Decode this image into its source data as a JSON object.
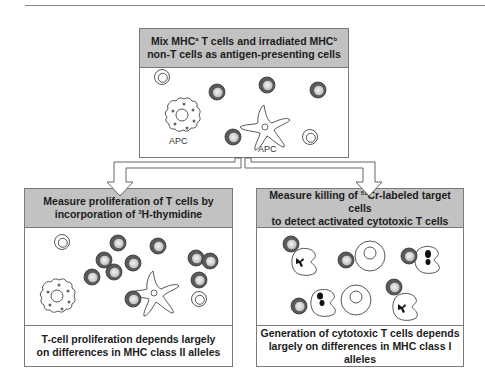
{
  "top_panel": {
    "title_line1_pre": "Mix MHC",
    "title_line1_sup1": "a",
    "title_line1_mid": " T cells and irradiated MHC",
    "title_line1_sup2": "b",
    "title_line2": "non-T cells as antigen-presenting cells",
    "labels": {
      "apc_left": "APC",
      "apc_right": "APC"
    }
  },
  "left_panel": {
    "title_line1": "Measure proliferation of T cells by",
    "title_line2_pre": "incorporation of ",
    "title_line2_sup": "3",
    "title_line2_post": "H-thymidine",
    "footer_line1": "T-cell proliferation depends largely",
    "footer_line2": "on differences in MHC class II alleles"
  },
  "right_panel": {
    "title_line1_pre": "Measure killing of ",
    "title_line1_sup": "51",
    "title_line1_post": "Cr-labeled target cells",
    "title_line2": "to detect activated cytotoxic T cells",
    "footer_line1": "Generation of cytotoxic T cells depends",
    "footer_line2": "largely on differences in MHC class I alleles"
  },
  "colors": {
    "header_fill": "#c2c2c2",
    "border": "#7a7a7a",
    "activated_cell_ring": "#555555",
    "activated_cell_core": "#e8e8e8"
  }
}
